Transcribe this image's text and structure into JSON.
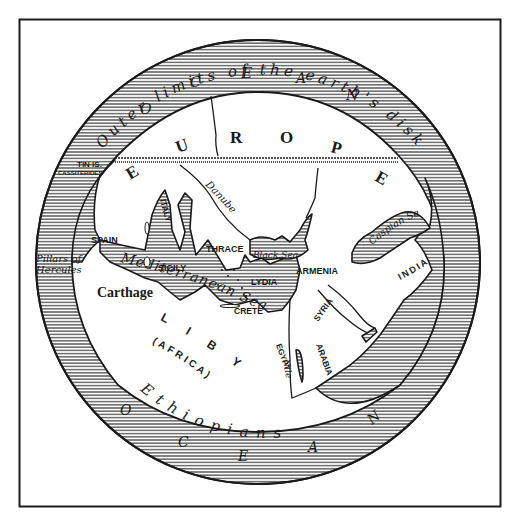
{
  "map": {
    "title_arc": "Outer limits of the earth's disk",
    "ocean_letters": {
      "top": [
        "O",
        "C",
        "E",
        "A",
        "N"
      ],
      "bottom": [
        "O",
        "C",
        "E",
        "A",
        "N"
      ]
    },
    "continents": {
      "europe": [
        "E",
        "U",
        "R",
        "O",
        "P",
        "E"
      ],
      "libya": "L I B Y A",
      "africa": "(AFRICA)"
    },
    "regions": {
      "spain": "SPAIN",
      "italy": "ITALY",
      "thrace": "THRACE",
      "sicily": "SICILY",
      "lydia": "LYDIA",
      "crete": "CRETE",
      "armenia": "ARMENIA",
      "india": "INDIA",
      "syria": "SYRIA",
      "arabia": "ARABIA",
      "egypt": "EGYPT",
      "carthage": "Carthage"
    },
    "waters": {
      "mediterranean": "Mediterranean Sea",
      "black_sea": "Black Sea",
      "caspian_sea": "Caspian Sea",
      "danube": "Danube",
      "nile": "Nile"
    },
    "other_labels": {
      "tin_islands": "TIN IS.",
      "cassiterides": "CASSITERIDES",
      "pillars_line1": "Pillars of",
      "pillars_line2": "Hercules",
      "ethiopians": "Ethiopians"
    },
    "colors": {
      "ink": "#1a1a1a",
      "paper": "#ffffff"
    }
  }
}
